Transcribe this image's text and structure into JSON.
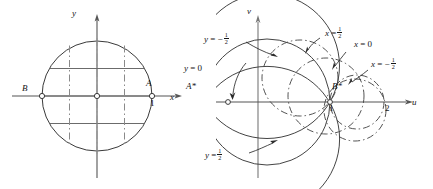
{
  "figure": {
    "caption": "Conformal mapping of the unit disk: coordinate lines x = const and y = const and their images"
  },
  "left_plane": {
    "axis_x_label": "x",
    "axis_y_label": "y",
    "point_A_label": "A",
    "point_A_value": "1",
    "point_B_label": "B",
    "origin_marker": "circle-marker",
    "solid_lines_meaning": "y = const",
    "dashed_lines_meaning": "x = const"
  },
  "right_plane": {
    "axis_u_label": "u",
    "axis_v_label": "v",
    "point_A_label": "A*",
    "point_B_label": "B*",
    "tick_1": "1",
    "tick_2": "2"
  },
  "labels": {
    "y_neg_half": {
      "lhs": "y",
      "eq": "=",
      "sign": "−",
      "num": "1",
      "den": "2"
    },
    "y_zero": {
      "lhs": "y",
      "eq": "=",
      "rhs": "0"
    },
    "y_pos_half": {
      "lhs": "y",
      "eq": "=",
      "sign": "",
      "num": "1",
      "den": "2"
    },
    "x_pos_half": {
      "lhs": "x",
      "eq": "=",
      "sign": "",
      "num": "1",
      "den": "2"
    },
    "x_zero": {
      "lhs": "x",
      "eq": "=",
      "rhs": "0"
    },
    "x_neg_half": {
      "lhs": "x",
      "eq": "=",
      "sign": "−",
      "num": "1",
      "den": "2"
    }
  },
  "colors": {
    "ink": "#151515",
    "line": "#3a3a3a",
    "grid": "#6b6b6b",
    "background": "#ffffff"
  }
}
